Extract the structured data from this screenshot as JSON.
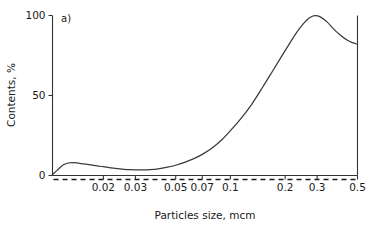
{
  "figure": {
    "panel_label": "a)",
    "background": "#ffffff",
    "curve_color": "#3a3a3a",
    "axis_color": "#333333"
  },
  "chart_data": {
    "type": "line",
    "title": "",
    "subtitle": "",
    "xlabel": "Particles size, mcm",
    "ylabel": "Contents, %",
    "xscale": "log",
    "yscale": "linear",
    "xlim": [
      0.0105,
      0.5
    ],
    "ylim": [
      0,
      100
    ],
    "grid": false,
    "legend": null,
    "annotations": [
      {
        "text": "a)",
        "x": 0.0125,
        "y": 97
      }
    ],
    "xticks": [
      0.02,
      0.03,
      0.05,
      0.07,
      0.1,
      0.2,
      0.3,
      0.5
    ],
    "xticklabels": [
      "0.02",
      "0.03",
      "0.05",
      "0.07",
      "0.1",
      "0.2",
      "0.3",
      "0.5"
    ],
    "yticks": [
      0,
      50,
      100
    ],
    "yticklabels": [
      "0",
      "50",
      "100"
    ],
    "reference_lines": [
      {
        "name": "zero-line",
        "orientation": "horizontal",
        "y": 0,
        "style": "dashed"
      },
      {
        "name": "right-boundary",
        "orientation": "vertical",
        "x": 0.5,
        "style": "solid"
      }
    ],
    "series": [
      {
        "name": "contents",
        "x": [
          0.0105,
          0.0112,
          0.012,
          0.0128,
          0.0135,
          0.0145,
          0.0155,
          0.017,
          0.0185,
          0.02,
          0.022,
          0.024,
          0.026,
          0.028,
          0.03,
          0.033,
          0.036,
          0.04,
          0.045,
          0.05,
          0.056,
          0.062,
          0.07,
          0.08,
          0.09,
          0.1,
          0.115,
          0.13,
          0.15,
          0.17,
          0.19,
          0.21,
          0.23,
          0.25,
          0.27,
          0.29,
          0.31,
          0.34,
          0.37,
          0.4,
          0.44,
          0.47,
          0.5
        ],
        "y": [
          0.5,
          3.5,
          6.5,
          7.8,
          8.1,
          7.8,
          7.3,
          6.6,
          6.0,
          5.5,
          4.8,
          4.3,
          3.9,
          3.6,
          3.5,
          3.5,
          3.7,
          4.2,
          5.2,
          6.4,
          8.2,
          10.2,
          13.2,
          17.5,
          22.5,
          28.0,
          36.0,
          44.0,
          55.0,
          65.0,
          74.0,
          82.0,
          89.0,
          94.5,
          98.3,
          99.9,
          99.3,
          96.0,
          91.5,
          88.0,
          84.5,
          83.0,
          82.0
        ]
      }
    ]
  }
}
